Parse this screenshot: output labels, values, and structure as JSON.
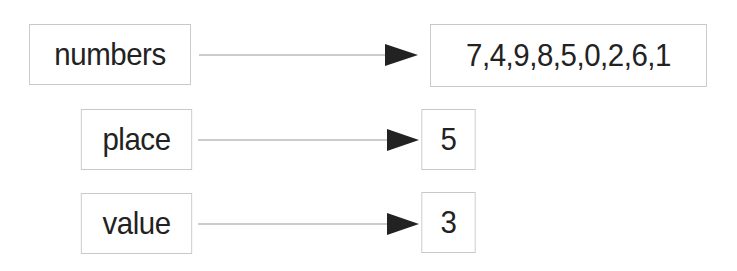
{
  "variables": [
    {
      "name": "numbers",
      "value": "7,4,9,8,5,0,2,6,1"
    },
    {
      "name": "place",
      "value": "5"
    },
    {
      "name": "value",
      "value": "3"
    }
  ],
  "colors": {
    "border": "#c8c8c8",
    "arrow": "#222222",
    "line": "#999999"
  }
}
